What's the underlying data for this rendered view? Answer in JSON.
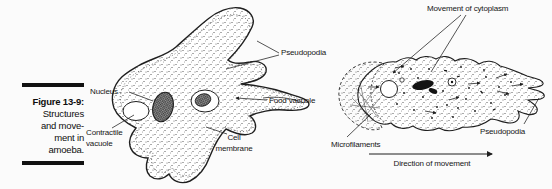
{
  "figure_caption": {
    "number": "Figure 13-9:",
    "lines": [
      "Structures",
      "and move-",
      "ment in",
      "amoeba."
    ]
  },
  "amoeba_structure_diagram": {
    "labels": {
      "nucleus": "Nucleus",
      "contractile_vacuole": "Contractile vacuole",
      "pseudopodia": "Pseudopodia",
      "food_vacuole": "Food vacuole",
      "cell_membrane": "Cell membrane"
    }
  },
  "amoeba_movement_diagram": {
    "labels": {
      "movement_of_cytoplasm": "Movement of cytoplasm",
      "microfilaments": "Microfilaments",
      "pseudopodia": "Pseudopodia",
      "direction_of_movement": "Direction of movement"
    }
  },
  "colors": {
    "ink": "#1f1f1f",
    "background": "#fbfbfb",
    "caption_bar": "#111111"
  }
}
